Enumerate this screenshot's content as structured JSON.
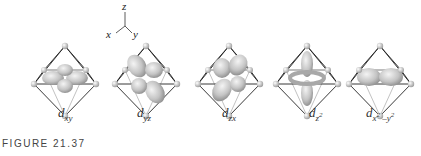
{
  "axes": {
    "x": "x",
    "y": "y",
    "z": "z"
  },
  "orbitals": [
    {
      "id": "dxy",
      "base": "d",
      "sub": "xy",
      "sup": ""
    },
    {
      "id": "dyz",
      "base": "d",
      "sub": "yz",
      "sup": ""
    },
    {
      "id": "dzx",
      "base": "d",
      "sub": "zx",
      "sup": ""
    },
    {
      "id": "dz2",
      "base": "d",
      "sub": "z",
      "sup": "2"
    },
    {
      "id": "dx2-y2",
      "base": "d",
      "sub": "x",
      "sup": "2",
      "sub2": " –y",
      "sup2": "2"
    }
  ],
  "figure_label": "FIGURE 21.37"
}
